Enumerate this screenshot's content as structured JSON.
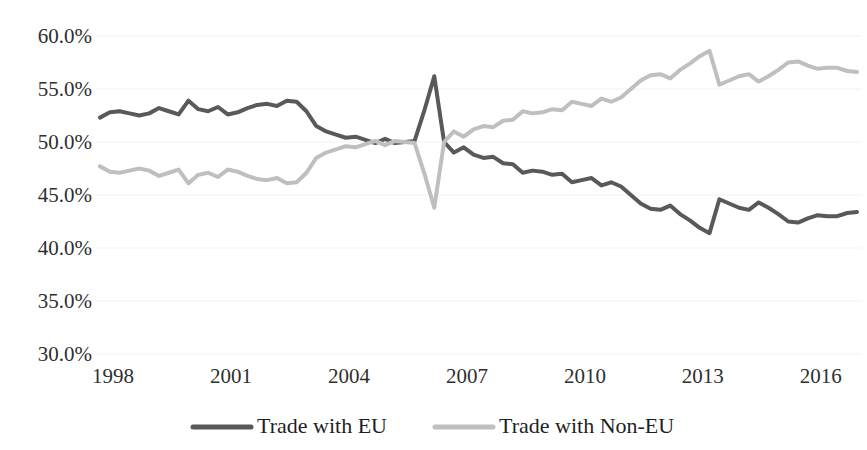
{
  "chart_data": {
    "type": "line",
    "title": "",
    "xlabel": "",
    "ylabel": "",
    "ylim": [
      30,
      60
    ],
    "yticks": [
      30,
      35,
      40,
      45,
      50,
      55,
      60
    ],
    "ytick_labels": [
      "30.0%",
      "35.0%",
      "40.0%",
      "45.0%",
      "50.0%",
      "55.0%",
      "60.0%"
    ],
    "xlim": [
      1998,
      2017.25
    ],
    "xticks": [
      1998,
      2001,
      2004,
      2007,
      2010,
      2013,
      2016
    ],
    "xtick_labels": [
      "1998",
      "2001",
      "2004",
      "2007",
      "2010",
      "2013",
      "2016"
    ],
    "grid": true,
    "grid_color": "#f2f2f2",
    "legend_position": "bottom",
    "legend": [
      "Trade with EU",
      "Trade with Non-EU"
    ],
    "series": [
      {
        "name": "Trade with EU",
        "color": "#595959",
        "width": 4,
        "x": [
          1998.0,
          1998.25,
          1998.5,
          1998.75,
          1999.0,
          1999.25,
          1999.5,
          1999.75,
          2000.0,
          2000.25,
          2000.5,
          2000.75,
          2001.0,
          2001.25,
          2001.5,
          2001.75,
          2002.0,
          2002.25,
          2002.5,
          2002.75,
          2003.0,
          2003.25,
          2003.5,
          2003.75,
          2004.0,
          2004.25,
          2004.5,
          2004.75,
          2005.0,
          2005.25,
          2005.5,
          2005.75,
          2006.0,
          2006.25,
          2006.5,
          2006.75,
          2007.0,
          2007.25,
          2007.5,
          2007.75,
          2008.0,
          2008.25,
          2008.5,
          2008.75,
          2009.0,
          2009.25,
          2009.5,
          2009.75,
          2010.0,
          2010.25,
          2010.5,
          2010.75,
          2011.0,
          2011.25,
          2011.5,
          2011.75,
          2012.0,
          2012.25,
          2012.5,
          2012.75,
          2013.0,
          2013.25,
          2013.5,
          2013.75,
          2014.0,
          2014.25,
          2014.5,
          2014.75,
          2015.0,
          2015.25,
          2015.5,
          2015.75,
          2016.0,
          2016.25,
          2016.5,
          2016.75,
          2017.0,
          2017.25
        ],
        "y": [
          52.3,
          52.8,
          52.9,
          52.7,
          52.5,
          52.7,
          53.2,
          52.9,
          52.6,
          53.9,
          53.1,
          52.9,
          53.3,
          52.6,
          52.8,
          53.2,
          53.5,
          53.6,
          53.4,
          53.9,
          53.8,
          52.9,
          51.5,
          51.0,
          50.7,
          50.4,
          50.5,
          50.2,
          49.9,
          50.3,
          49.9,
          50.0,
          50.1,
          53.0,
          56.2,
          50.0,
          49.0,
          49.5,
          48.8,
          48.5,
          48.6,
          48.0,
          47.9,
          47.1,
          47.3,
          47.2,
          46.9,
          47.0,
          46.2,
          46.4,
          46.6,
          45.9,
          46.2,
          45.8,
          45.0,
          44.2,
          43.7,
          43.6,
          44.0,
          43.2,
          42.6,
          41.9,
          41.4,
          44.6,
          44.2,
          43.8,
          43.6,
          44.3,
          43.8,
          43.2,
          42.5,
          42.4,
          42.8,
          43.1,
          43.0,
          43.0,
          43.3,
          43.4
        ]
      },
      {
        "name": "Trade with Non-EU",
        "color": "#bfbfbf",
        "width": 4,
        "x": [
          1998.0,
          1998.25,
          1998.5,
          1998.75,
          1999.0,
          1999.25,
          1999.5,
          1999.75,
          2000.0,
          2000.25,
          2000.5,
          2000.75,
          2001.0,
          2001.25,
          2001.5,
          2001.75,
          2002.0,
          2002.25,
          2002.5,
          2002.75,
          2003.0,
          2003.25,
          2003.5,
          2003.75,
          2004.0,
          2004.25,
          2004.5,
          2004.75,
          2005.0,
          2005.25,
          2005.5,
          2005.75,
          2006.0,
          2006.25,
          2006.5,
          2006.75,
          2007.0,
          2007.25,
          2007.5,
          2007.75,
          2008.0,
          2008.25,
          2008.5,
          2008.75,
          2009.0,
          2009.25,
          2009.5,
          2009.75,
          2010.0,
          2010.25,
          2010.5,
          2010.75,
          2011.0,
          2011.25,
          2011.5,
          2011.75,
          2012.0,
          2012.25,
          2012.5,
          2012.75,
          2013.0,
          2013.25,
          2013.5,
          2013.75,
          2014.0,
          2014.25,
          2014.5,
          2014.75,
          2015.0,
          2015.25,
          2015.5,
          2015.75,
          2016.0,
          2016.25,
          2016.5,
          2016.75,
          2017.0,
          2017.25
        ],
        "y": [
          47.7,
          47.2,
          47.1,
          47.3,
          47.5,
          47.3,
          46.8,
          47.1,
          47.4,
          46.1,
          46.9,
          47.1,
          46.7,
          47.4,
          47.2,
          46.8,
          46.5,
          46.4,
          46.6,
          46.1,
          46.2,
          47.1,
          48.5,
          49.0,
          49.3,
          49.6,
          49.5,
          49.8,
          50.1,
          49.7,
          50.1,
          50.0,
          49.9,
          47.0,
          43.8,
          50.0,
          51.0,
          50.5,
          51.2,
          51.5,
          51.4,
          52.0,
          52.1,
          52.9,
          52.7,
          52.8,
          53.1,
          53.0,
          53.8,
          53.6,
          53.4,
          54.1,
          53.8,
          54.2,
          55.0,
          55.8,
          56.3,
          56.4,
          56.0,
          56.8,
          57.4,
          58.1,
          58.6,
          55.4,
          55.8,
          56.2,
          56.4,
          55.7,
          56.2,
          56.8,
          57.5,
          57.6,
          57.2,
          56.9,
          57.0,
          57.0,
          56.7,
          56.6
        ]
      }
    ]
  },
  "axis": {
    "y_labels": [
      "60.0%",
      "55.0%",
      "50.0%",
      "45.0%",
      "40.0%",
      "35.0%",
      "30.0%"
    ],
    "x_labels": [
      "1998",
      "2001",
      "2004",
      "2007",
      "2010",
      "2013",
      "2016"
    ]
  },
  "legend": {
    "items": [
      {
        "label": "Trade with EU",
        "color": "#595959"
      },
      {
        "label": "Trade with Non-EU",
        "color": "#bfbfbf"
      }
    ]
  }
}
